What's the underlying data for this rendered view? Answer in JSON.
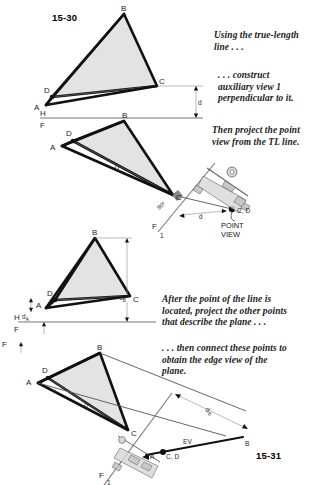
{
  "figure": {
    "number_top": "15-30",
    "number_bottom": "15-31"
  },
  "captions": [
    {
      "id": "caption-1",
      "lines": [
        "Using the true-length",
        "line . . ."
      ]
    },
    {
      "id": "caption-2",
      "lines": [
        ". . . construct",
        "auxiliary view 1",
        "perpendicular to it."
      ]
    },
    {
      "id": "caption-3",
      "lines": [
        "Then project the point",
        "view from the TL line."
      ]
    },
    {
      "id": "caption-4",
      "lines": [
        "After the point of the line is",
        "located, project the other points",
        "that describe the plane . . ."
      ]
    },
    {
      "id": "caption-5",
      "lines": [
        ". . . then connect these points to",
        "obtain the edge view of the",
        "plane."
      ]
    }
  ],
  "views": {
    "view1": {
      "name": "top-view-front-view-with-d",
      "vertices": {
        "A": "A",
        "B": "B",
        "C": "C",
        "D": "D"
      },
      "reference_line": {
        "upper": "H",
        "lower": "F"
      },
      "dimension": "d"
    },
    "view2": {
      "name": "rotated-plane-with-point-view",
      "vertices": {
        "A": "A",
        "B": "B",
        "C": "C",
        "D": "D"
      },
      "true_length_label": "TL",
      "angle_label": "90º",
      "dimension": "d",
      "point_label": "C, D",
      "point_view_label": [
        "POINT",
        "VIEW"
      ],
      "reference_line": {
        "upper": "F",
        "lower": "1"
      }
    },
    "view3": {
      "name": "front-view-with-da-db",
      "vertices": {
        "A": "A",
        "B": "B",
        "C": "C",
        "D": "D"
      },
      "reference_line": {
        "upper": "H",
        "lower": "F"
      },
      "dimensions": {
        "a": "d",
        "a_sub": "A",
        "b": "d",
        "b_sub": "B"
      }
    },
    "view4": {
      "name": "edge-view-construction",
      "vertices": {
        "A": "A",
        "B": "B",
        "C": "C",
        "D": "D"
      },
      "true_length_label": "TL",
      "dimension": "d",
      "dimension_sub": "B",
      "edge_view_label": "EV",
      "point_label": "C, D",
      "point_a_label": "A",
      "point_b_label": "B",
      "reference_line": {
        "upper": "F",
        "lower": "1"
      }
    }
  },
  "colors": {
    "plane_fill": "#e3e3e3",
    "outline": "#111111",
    "thin_line": "#6e6e6e",
    "reference_line": "#777777",
    "text": "#1a1a1a"
  }
}
